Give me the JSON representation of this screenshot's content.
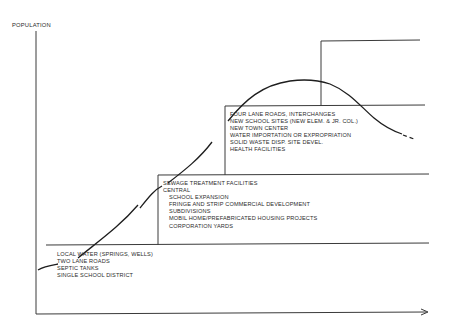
{
  "diagram": {
    "y_axis_label": "POPULATION",
    "x_axis_label": "",
    "colors": {
      "line": "#3a3a3a",
      "curve": "#1e1e1e",
      "background": "#ffffff"
    },
    "stages": [
      {
        "id": "stage-1",
        "lines": [
          "LOCAL WATER (SPRINGS, WELLS)",
          "TWO LANE ROADS",
          "SEPTIC TANKS",
          "SINGLE SCHOOL DISTRICT"
        ]
      },
      {
        "id": "stage-2",
        "heading": "SEWAGE TREATMENT FACILITIES",
        "subheading": "CENTRAL",
        "lines": [
          "SCHOOL EXPANSION",
          "FRINGE AND STRIP COMMERCIAL DEVELOPMENT",
          "SUBDIVISIONS",
          "MOBIL HOME/PREFABRICATED HOUSING PROJECTS",
          "CORPORATION YARDS"
        ]
      },
      {
        "id": "stage-3",
        "lines": [
          "FOUR LANE ROADS, INTERCHANGES",
          "NEW SCHOOL SITES (NEW ELEM. & JR. COL.)",
          "NEW TOWN CENTER",
          "WATER IMPORTATION OR EXPROPRIATION",
          "SOLID WASTE DISP. SITE DEVEL.",
          "HEALTH FACILITIES"
        ]
      },
      {
        "id": "stage-4",
        "lines": []
      }
    ],
    "curve_description": "Population growth curve rising through infrastructure thresholds, peaking then declining (dashed projection)"
  }
}
